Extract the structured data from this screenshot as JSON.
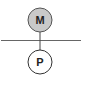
{
  "diagram": {
    "nodes": [
      {
        "id": "top",
        "label": "M",
        "fill": "#c9c9c9",
        "stroke": "#555555"
      },
      {
        "id": "bottom",
        "label": "P",
        "fill": "#ffffff",
        "stroke": "#333333"
      }
    ],
    "edges": [
      {
        "from": "top",
        "to": "bottom"
      }
    ],
    "line_color": "#555555"
  }
}
